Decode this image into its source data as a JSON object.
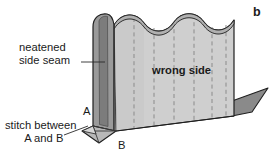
{
  "figure": {
    "panel_letter": "b"
  },
  "labels": {
    "neatened_side_seam": {
      "line1": "neatened",
      "line2": "side seam"
    },
    "wrong_side": "wrong side",
    "stitch_between": {
      "line1": "stitch between",
      "line2": "A and B"
    },
    "point_a": "A",
    "point_b": "B"
  },
  "colors": {
    "main_face": "#cfcfcf",
    "side_panel": "#8f8f8f",
    "side_panel_dark": "#7a7a7a",
    "top_edge": "#b3b3b3",
    "shadow_flap": "#8a8a8a",
    "outline": "#1f1f1f",
    "dashed_line": "#8d8d8d",
    "text": "#1a1a1a",
    "background": "#ffffff"
  },
  "geometry": {
    "scallop_count": 4,
    "dashed_fold_line_count": 6,
    "leader_lines": 2
  }
}
